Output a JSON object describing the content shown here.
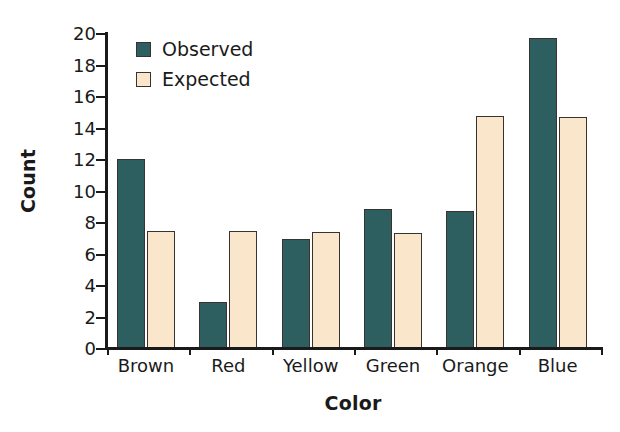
{
  "chart_data": {
    "type": "bar",
    "title": "",
    "xlabel": "Color",
    "ylabel": "Count",
    "categories": [
      "Brown",
      "Red",
      "Yellow",
      "Green",
      "Orange",
      "Blue"
    ],
    "series": [
      {
        "name": "Observed",
        "color": "#2d5f60",
        "values": [
          12.0,
          2.9,
          6.9,
          8.8,
          8.7,
          19.7
        ]
      },
      {
        "name": "Expected",
        "color": "#fae6cb",
        "values": [
          7.4,
          7.4,
          7.35,
          7.3,
          14.7,
          14.65
        ]
      }
    ],
    "ylim": [
      0,
      20
    ],
    "ytick_labels": [
      "20",
      "18",
      "16",
      "14",
      "12",
      "10",
      "8",
      "6",
      "4",
      "2",
      "0"
    ],
    "ytick_values": [
      20,
      18,
      16,
      14,
      12,
      10,
      8,
      6,
      4,
      2,
      0
    ],
    "grid": false,
    "legend_position": "upper-left-inside"
  },
  "legend": {
    "items": [
      {
        "label": "Observed",
        "swatch": "observed-swatch"
      },
      {
        "label": "Expected",
        "swatch": "expected-swatch"
      }
    ]
  }
}
